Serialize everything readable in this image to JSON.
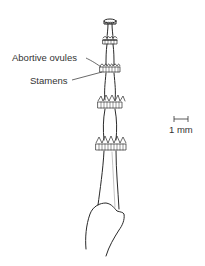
{
  "figure": {
    "type": "botanical line drawing"
  },
  "labels": {
    "abortive_ovules": "Abortive ovules",
    "stamens": "Stamens",
    "scale_bar": "1 mm"
  },
  "colors": {
    "line": "#2a2a2a",
    "text": "#333333",
    "background": "#ffffff"
  }
}
